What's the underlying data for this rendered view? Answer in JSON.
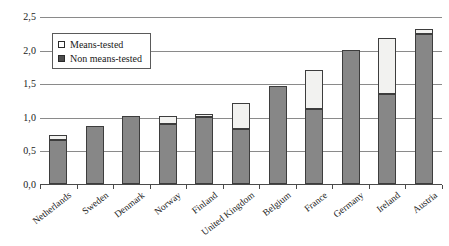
{
  "chart_data": {
    "type": "bar",
    "stacked": true,
    "title": "",
    "subtitle": "",
    "xlabel": "",
    "ylabel": "",
    "ylim": [
      0.0,
      2.5
    ],
    "ytick_labels": [
      "0,0",
      "0,5",
      "1,0",
      "1,5",
      "2,0",
      "2,5"
    ],
    "ytick_values": [
      0.0,
      0.5,
      1.0,
      1.5,
      2.0,
      2.5
    ],
    "grid": true,
    "legend_position": "top-left inside plot",
    "categories": [
      "Netherlands",
      "Sweden",
      "Denmark",
      "Norway",
      "Finland",
      "United Kingdom",
      "Belgium",
      "France",
      "Germany",
      "Ireland",
      "Austria"
    ],
    "series": [
      {
        "name": "Non means-tested",
        "fill": "#878787",
        "values": [
          0.66,
          0.87,
          1.02,
          0.9,
          1.0,
          0.82,
          1.47,
          1.12,
          2.0,
          1.35,
          2.25
        ]
      },
      {
        "name": "Means-tested",
        "fill": "#f2f2f0",
        "values": [
          0.07,
          0.0,
          0.0,
          0.12,
          0.05,
          0.4,
          0.0,
          0.58,
          0.0,
          0.83,
          0.07
        ]
      }
    ],
    "totals": [
      0.73,
      0.87,
      1.02,
      1.02,
      1.05,
      1.22,
      1.47,
      1.7,
      2.0,
      2.18,
      2.32
    ]
  },
  "legend": {
    "items": [
      {
        "label": "Means-tested",
        "swatch": "light-square-swatch"
      },
      {
        "label": "Non means-tested",
        "swatch": "dark-square-swatch"
      }
    ]
  }
}
